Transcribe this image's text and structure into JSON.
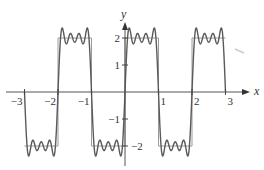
{
  "chart_data": {
    "type": "line",
    "title": "",
    "xlabel": "x",
    "ylabel": "y",
    "xlim": [
      -3,
      3
    ],
    "ylim": [
      -2,
      2
    ],
    "grid": false,
    "legend": null,
    "x_ticks": [
      -3,
      -2,
      -1,
      1,
      2,
      3
    ],
    "x_tick_labels": [
      "−3",
      "−2",
      "−1",
      "1",
      "2",
      "3"
    ],
    "y_ticks": [
      2,
      1,
      -1,
      -2
    ],
    "y_tick_labels": [
      "2",
      "1",
      "−1",
      "−2"
    ],
    "series": [
      {
        "name": "square wave",
        "kind": "step",
        "color": "#888888",
        "description": "Square wave of period 2: y = 2 on (0,1), y = −2 on (−1,0)",
        "x": [
          -3,
          -2,
          -2,
          -1,
          -1,
          0,
          0,
          1,
          1,
          2,
          2,
          3
        ],
        "y": [
          -2,
          -2,
          2,
          2,
          -2,
          -2,
          2,
          2,
          -2,
          -2,
          2,
          2
        ]
      },
      {
        "name": "Fourier partial sum",
        "kind": "function",
        "color": "#555555",
        "description": "(8/π)·Σ sin(nπx)/n for odd n = 1,3,5,7",
        "amplitude": 2,
        "harmonics": [
          1,
          3,
          5,
          7
        ],
        "x_range": [
          -3,
          3
        ]
      }
    ],
    "annotations": []
  },
  "axes": {
    "x_label": "x",
    "y_label": "y"
  }
}
